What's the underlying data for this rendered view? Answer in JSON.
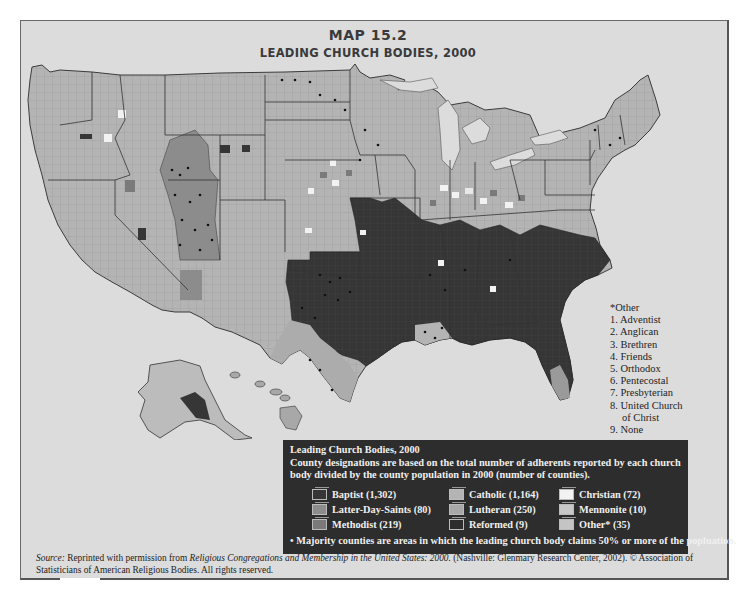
{
  "title": {
    "map_number": "MAP 15.2",
    "heading": "LEADING CHURCH BODIES, 2000"
  },
  "colors": {
    "frame_background": "#dcdcdc",
    "baptist": "#363636",
    "catholic": "#b4b4b4",
    "christian": "#f2f2f2",
    "latter_day_saints": "#8c8c8c",
    "lutheran": "#a8a8a8",
    "mennonite": "#c8c8c8",
    "methodist": "#7a7a7a",
    "reformed": "#2d2d2d",
    "other": "#c4c4c4",
    "legend_background": "#2d2d2d"
  },
  "other_list": {
    "header": "*Other",
    "items": [
      "1. Adventist",
      "2. Anglican",
      "3. Brethren",
      "4. Friends",
      "5. Orthodox",
      "6. Pentecostal",
      "7. Presbyterian",
      "8. United Church",
      "    of Christ",
      "9. None"
    ]
  },
  "legend": {
    "title": "Leading Church Bodies, 2000",
    "description": "County designations are based on the total number of adherents reported by each church body divided by the county population in 2000 (number of counties).",
    "items": [
      {
        "label": "Baptist (1,302)",
        "key": "baptist"
      },
      {
        "label": "Catholic (1,164)",
        "key": "catholic"
      },
      {
        "label": "Christian (72)",
        "key": "christian"
      },
      {
        "label": "Latter-Day-Saints (80)",
        "key": "latter_day_saints"
      },
      {
        "label": "Lutheran (250)",
        "key": "lutheran"
      },
      {
        "label": "Mennonite (10)",
        "key": "mennonite"
      },
      {
        "label": "Methodist (219)",
        "key": "methodist"
      },
      {
        "label": "Reformed (9)",
        "key": "reformed"
      },
      {
        "label": "Other* (35)",
        "key": "other"
      }
    ],
    "footnote": "• Majority counties are areas in which the leading church body claims 50% or more of the popluation."
  },
  "source": {
    "label": "Source:",
    "text_before": " Reprinted with permission from ",
    "book": "Religious Congregations and Membership in the United States: 2000.",
    "text_after": " (Nashville: Glenmary Research Center, 2002). © Association of Statisticians of American Religious Bodies. All rights reserved."
  }
}
